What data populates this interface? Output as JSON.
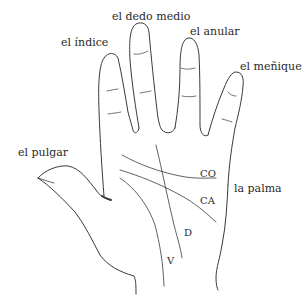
{
  "diagram": {
    "labels": {
      "thumb": "el pulgar",
      "index": "el índice",
      "middle": "el dedo medio",
      "ring": "el anular",
      "pinky": "el meñique",
      "palm": "la palma"
    },
    "palm_lines": {
      "heart_line": "CO",
      "head_line": "CA",
      "fate_line": "D",
      "life_line": "V"
    },
    "colors": {
      "background": "#ffffff",
      "stroke": "#3a3a3a",
      "text": "#2a2a2a"
    }
  }
}
